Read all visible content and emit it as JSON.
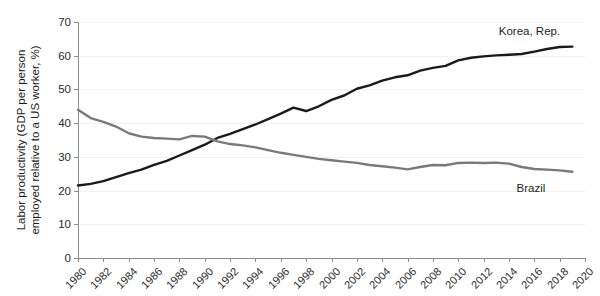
{
  "chart_data": {
    "type": "line",
    "title": "",
    "xlabel": "",
    "ylabel": "Labor productivity (GDP per person employed relative to a US worker, %)",
    "ylabel_line1": "Labor productivity (GDP per person",
    "ylabel_line2": "employed relative to a US worker, %)",
    "xlim": [
      1980,
      2020
    ],
    "ylim": [
      0,
      70
    ],
    "y_ticks": [
      0,
      10,
      20,
      30,
      40,
      50,
      60,
      70
    ],
    "x_ticks": [
      1980,
      1982,
      1984,
      1986,
      1988,
      1990,
      1992,
      1994,
      1996,
      1998,
      2000,
      2002,
      2004,
      2006,
      2008,
      2010,
      2012,
      2014,
      2016,
      2018,
      2020
    ],
    "grid": true,
    "legend_position": "line-end-labels",
    "x": [
      1980,
      1981,
      1982,
      1983,
      1984,
      1985,
      1986,
      1987,
      1988,
      1989,
      1990,
      1991,
      1992,
      1993,
      1994,
      1995,
      1996,
      1997,
      1998,
      1999,
      2000,
      2001,
      2002,
      2003,
      2004,
      2005,
      2006,
      2007,
      2008,
      2009,
      2010,
      2011,
      2012,
      2013,
      2014,
      2015,
      2016,
      2017,
      2018,
      2019
    ],
    "series": [
      {
        "name": "Korea, Rep.",
        "color": "#1a1a1a",
        "label_x": 2013.2,
        "label_y": 67.0,
        "values": [
          21.5,
          22.0,
          22.8,
          24.0,
          25.2,
          26.2,
          27.6,
          28.8,
          30.4,
          32.0,
          33.6,
          35.6,
          36.8,
          38.2,
          39.6,
          41.2,
          42.8,
          44.6,
          43.6,
          45.0,
          46.9,
          48.2,
          50.2,
          51.2,
          52.6,
          53.6,
          54.2,
          55.6,
          56.4,
          57.0,
          58.6,
          59.4,
          59.8,
          60.1,
          60.3,
          60.5,
          61.2,
          62.0,
          62.6,
          62.7
        ]
      },
      {
        "name": "Brazil",
        "color": "#7a7a7a",
        "label_x": 2014.6,
        "label_y": 20.4,
        "values": [
          44.0,
          41.5,
          40.4,
          39.0,
          37.0,
          36.0,
          35.6,
          35.4,
          35.2,
          36.2,
          36.0,
          34.6,
          33.8,
          33.4,
          32.8,
          32.0,
          31.2,
          30.6,
          30.0,
          29.4,
          29.0,
          28.6,
          28.2,
          27.6,
          27.2,
          26.8,
          26.3,
          27.0,
          27.6,
          27.5,
          28.2,
          28.3,
          28.2,
          28.3,
          28.0,
          27.0,
          26.4,
          26.2,
          26.0,
          25.6
        ]
      }
    ]
  }
}
